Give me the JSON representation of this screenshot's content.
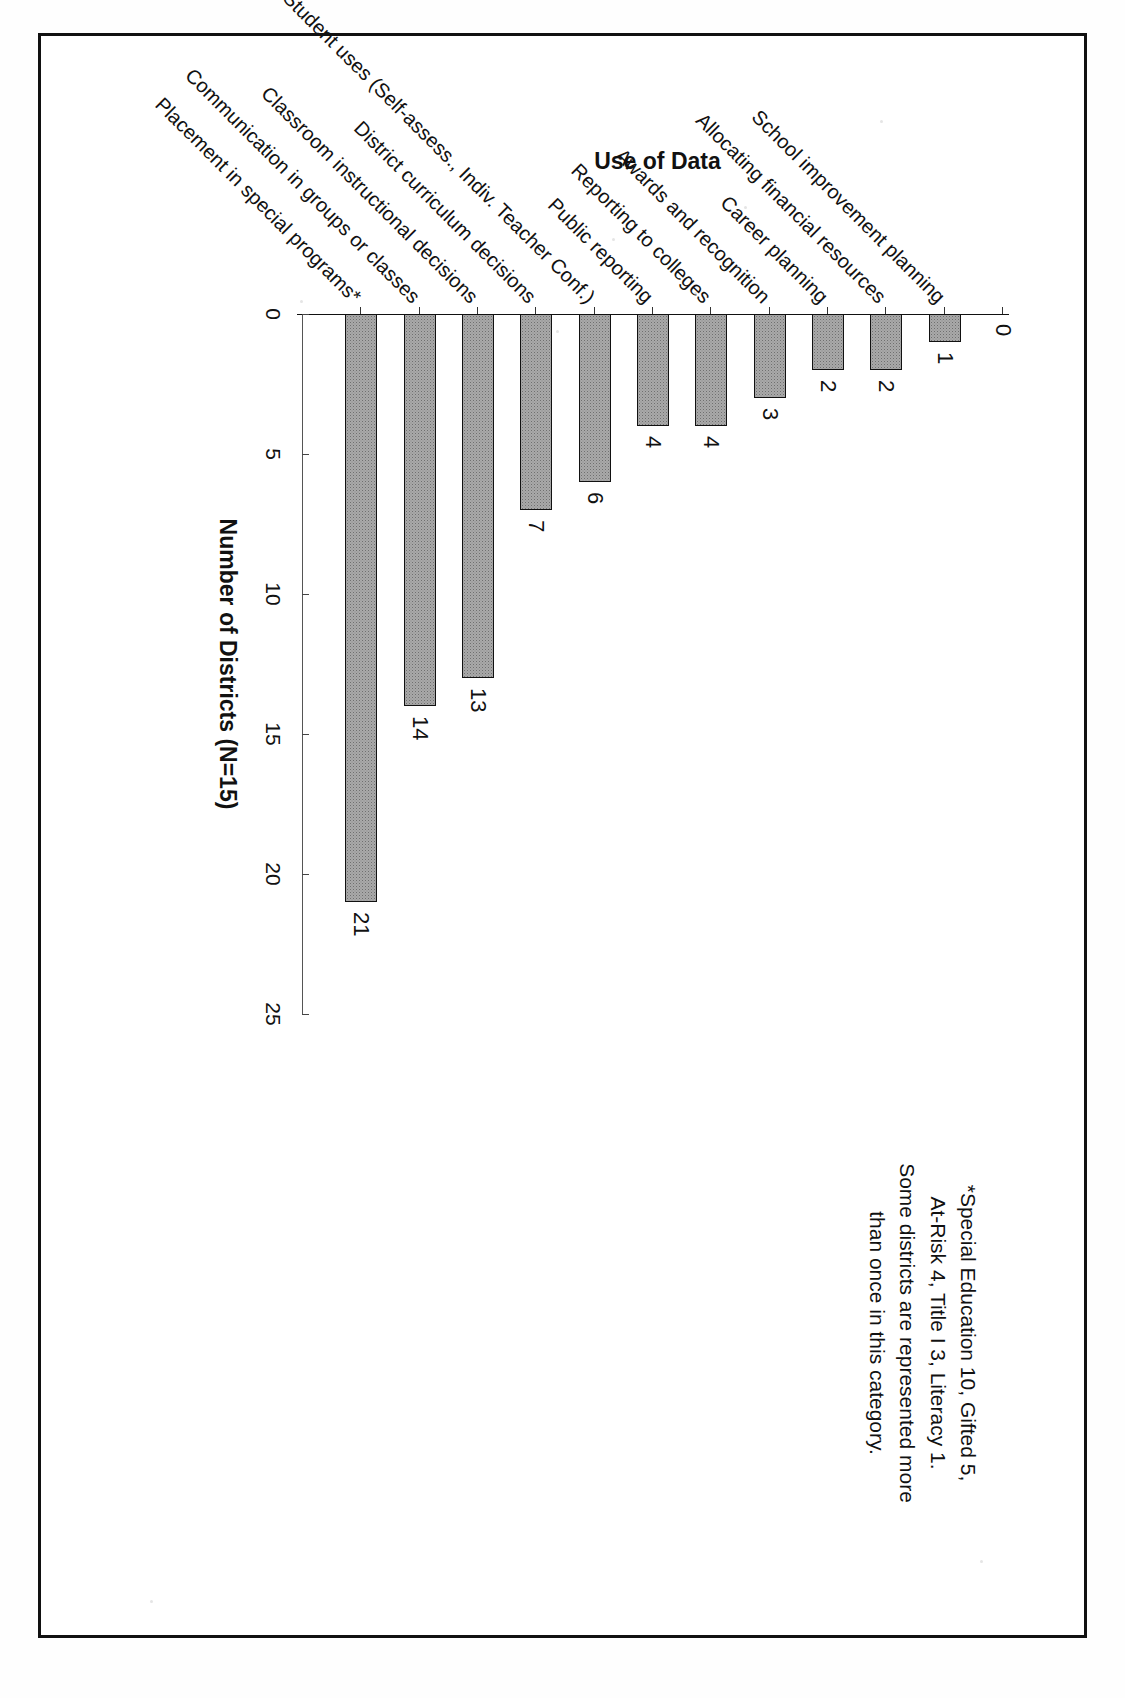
{
  "figure": {
    "value_axis_title": "Number of Districts (N=15)",
    "category_axis_title": "Use of Data",
    "footnote_lines": [
      "*Special Education 10, Gifted 5,",
      "At-Risk 4, Title I 3, Literacy 1.",
      "Some districts are represented more",
      "than once in this category."
    ]
  },
  "chart_data": {
    "type": "bar",
    "orientation": "horizontal",
    "title": "",
    "xlabel": "Number of Districts (N=15)",
    "ylabel": "Use of Data",
    "xlim": [
      0,
      25
    ],
    "xticks": [
      "25",
      "20",
      "15",
      "10",
      "5",
      "0"
    ],
    "xtick_values": [
      25,
      20,
      15,
      10,
      5,
      0
    ],
    "grid": false,
    "legend": "none",
    "bar_fill_color": "#a9a9a9",
    "bar_edge_color": "#111111",
    "categories": [
      "Placement in special programs*",
      "Communication in groups or classes",
      "Classroom instructional decisions",
      "District curriculum decisions",
      "Student uses (Self-assess., Indiv. Teacher Conf.)",
      "Public reporting",
      "Reporting to colleges",
      "Awards and recognition",
      "Career planning",
      "Allocating financial resources",
      "School improvement planning"
    ],
    "values": [
      21,
      14,
      13,
      7,
      6,
      4,
      4,
      3,
      2,
      2,
      1
    ],
    "data_labels": [
      "21",
      "14",
      "13",
      "7",
      "6",
      "4",
      "4",
      "3",
      "2",
      "2",
      "1"
    ],
    "extra_ticks": [
      "1",
      "0"
    ],
    "note": "Bar value labels are printed at the end of each bar; the final category shows 0 with no visible bar."
  }
}
